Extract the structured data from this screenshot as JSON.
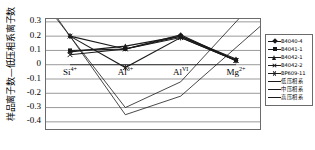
{
  "chart_data": {
    "type": "line",
    "title": "",
    "xlabel": "",
    "ylabel": "样品离子数—低压相系离子数",
    "categories": [
      "Si4+",
      "Al3+",
      "AlVI",
      "Mg2+"
    ],
    "category_labels": [
      {
        "base": "Si",
        "sup": "4+"
      },
      {
        "base": "Al",
        "sup": "3+"
      },
      {
        "base": "Al",
        "sup": "VI"
      },
      {
        "base": "Mg",
        "sup": "2+"
      }
    ],
    "ylim": [
      -0.45,
      0.32
    ],
    "yticks": [
      0.3,
      0.2,
      0.1,
      0,
      -0.1,
      -0.2,
      -0.3,
      -0.4
    ],
    "ytick_labels": [
      "0.3",
      "0.2",
      "0.1",
      "0",
      "-0.1",
      "-0.2",
      "-0.3",
      "-0.4"
    ],
    "grid": true,
    "legend_position": "right",
    "series": [
      {
        "name": "B4040-4",
        "marker": "diamond",
        "values": [
          0.2,
          0.11,
          0.21,
          0.03
        ]
      },
      {
        "name": "B4041-1",
        "marker": "square",
        "values": [
          0.1,
          0.11,
          0.2,
          0.03
        ]
      },
      {
        "name": "B4042-1",
        "marker": "tri",
        "values": [
          0.09,
          0.13,
          0.2,
          0.04
        ]
      },
      {
        "name": "B4042-2",
        "marker": "x",
        "values": [
          0.07,
          0.11,
          0.19,
          0.03
        ]
      },
      {
        "name": "BP609-11",
        "marker": "star",
        "values": [
          0.2,
          -0.02,
          0.19,
          0.03
        ]
      },
      {
        "name": "低压相系",
        "marker": "none",
        "values": [
          0.0,
          0.0,
          0.0,
          0.0
        ]
      },
      {
        "name": "中压相系",
        "marker": "none",
        "values": [
          0.2,
          -0.3,
          -0.12,
          0.3
        ]
      },
      {
        "name": "高压相系",
        "marker": "none",
        "values": [
          0.2,
          -0.35,
          -0.22,
          0.12
        ]
      }
    ]
  },
  "legend": {
    "entries": [
      {
        "label": "B4040-4"
      },
      {
        "label": "B4041-1"
      },
      {
        "label": "B4042-1"
      },
      {
        "label": "B4042-2"
      },
      {
        "label": "BP609-11"
      },
      {
        "label": "低压相系"
      },
      {
        "label": "中压相系"
      },
      {
        "label": "高压相系"
      }
    ]
  },
  "colors": {
    "line": "#1a1a1a",
    "grid": "#9a9a9a",
    "frame": "#6b6b6b",
    "background": "#ffffff",
    "text": "#000000"
  }
}
